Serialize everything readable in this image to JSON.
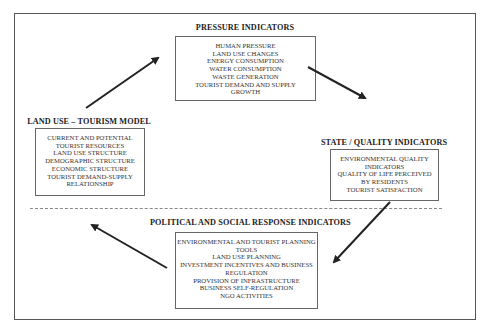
{
  "diagram": {
    "pressure": {
      "title": "PRESSURE INDICATORS",
      "items": [
        "HUMAN PRESSURE",
        "LAND USE CHANGES",
        "ENERGY CONSUMPTION",
        "WATER CONSUMPTION",
        "WASTE GENERATION",
        "TOURIST DEMAND AND SUPPLY",
        "GROWTH"
      ]
    },
    "land_use": {
      "title": "LAND USE – TOURISM MODEL",
      "items": [
        "CURRENT AND POTENTIAL",
        "TOURIST RESOURCES",
        "LAND USE  STRUCTURE",
        "DEMOGRAPHIC STRUCTURE",
        "ECONOMIC STRUCTURE",
        "TOURIST DEMAND-SUPPLY",
        "RELATIONSHIP"
      ]
    },
    "state": {
      "title": "STATE / QUALITY INDICATORS",
      "items": [
        "ENVIRONMENTAL QUALITY",
        "INDICATORS",
        "QUALITY OF LIFE PERCEIVED",
        "BY RESIDENTS",
        "TOURIST SATISFACTION"
      ]
    },
    "response": {
      "title": "POLITICAL AND SOCIAL RESPONSE INDICATORS",
      "items": [
        "ENVIRONMENTAL AND TOURIST PLANNING",
        "TOOLS",
        "LAND USE  PLANNING",
        "INVESTMENT INCENTIVES AND BUSINESS",
        "REGULATION",
        "PROVISION OF INFRASTRUCTURE",
        "BUSINESS SELF-REGULATION",
        "NGO  ACTIVITIES"
      ]
    },
    "arrows": [
      {
        "from": "land_use",
        "to": "pressure"
      },
      {
        "from": "pressure",
        "to": "state"
      },
      {
        "from": "state",
        "to": "response"
      },
      {
        "from": "response",
        "to": "land_use"
      }
    ],
    "colors": {
      "line": "#222222",
      "border": "#666666"
    }
  }
}
